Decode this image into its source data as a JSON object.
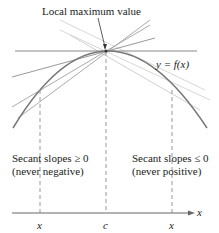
{
  "title_label": "Local maximum value",
  "curve_label": "y = f(x)",
  "left_region": {
    "line1": "Secant slopes ≥ 0",
    "line2": "(never negative)"
  },
  "right_region": {
    "line1": "Secant slopes ≤ 0",
    "line2": "(never positive)"
  },
  "axis": {
    "label": "x",
    "ticks": [
      "x",
      "c",
      "x"
    ]
  },
  "colors": {
    "curve": "#777777",
    "lines": "#999999",
    "light_lines": "#cccccc",
    "text": "#222222"
  }
}
